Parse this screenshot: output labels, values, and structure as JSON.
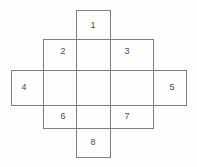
{
  "figure": {
    "kind": "cross-plus-grid-diagram",
    "background_color": "#fdfdfd",
    "line_color": "#7e7e7e",
    "label_color": "#4a4a4a",
    "line_width": 1,
    "canvas": {
      "width": 197,
      "height": 167
    },
    "geometry": {
      "outer_left": 11,
      "outer_right": 186,
      "outer_top": 10,
      "outer_bottom": 157,
      "vbar_left": 76,
      "vbar_right": 110,
      "hbar_top": 70,
      "hbar_bottom": 105,
      "inner_left": 43,
      "inner_right": 153,
      "inner_top": 39,
      "inner_bottom": 128,
      "cross_outline_points": "76,10 110,10 110,39 153,39 153,70 186,70 186,105 153,105 153,128 110,128 110,157 76,157 76,128 43,128 43,105 11,105 11,70 43,70 43,39 76,39 76,10",
      "divider_segments": [
        {
          "name": "vbar-left-edge",
          "x1": 76,
          "y1": 10,
          "x2": 76,
          "y2": 157
        },
        {
          "name": "vbar-right-edge",
          "x1": 110,
          "y1": 10,
          "x2": 110,
          "y2": 157
        },
        {
          "name": "hbar-top-edge",
          "x1": 11,
          "y1": 70,
          "x2": 186,
          "y2": 70
        },
        {
          "name": "hbar-bottom-edge",
          "x1": 11,
          "y1": 105,
          "x2": 186,
          "y2": 105
        },
        {
          "name": "inner-left-edge",
          "x1": 43,
          "y1": 39,
          "x2": 43,
          "y2": 128
        },
        {
          "name": "inner-right-edge",
          "x1": 153,
          "y1": 39,
          "x2": 153,
          "y2": 128
        },
        {
          "name": "inner-top-edge",
          "x1": 43,
          "y1": 39,
          "x2": 153,
          "y2": 39
        },
        {
          "name": "inner-bottom-edge",
          "x1": 43,
          "y1": 128,
          "x2": 153,
          "y2": 128
        }
      ]
    },
    "cells": [
      {
        "id": "cell-1",
        "label": "1",
        "position": "top",
        "cx": 93,
        "cy": 26
      },
      {
        "id": "cell-2",
        "label": "2",
        "position": "upper-left",
        "cx": 63,
        "cy": 52
      },
      {
        "id": "cell-3",
        "label": "3",
        "position": "upper-right",
        "cx": 127,
        "cy": 52
      },
      {
        "id": "cell-4",
        "label": "4",
        "position": "left",
        "cx": 24,
        "cy": 88
      },
      {
        "id": "cell-5",
        "label": "5",
        "position": "right",
        "cx": 172,
        "cy": 88
      },
      {
        "id": "cell-6",
        "label": "6",
        "position": "lower-left",
        "cx": 63,
        "cy": 117
      },
      {
        "id": "cell-7",
        "label": "7",
        "position": "lower-right",
        "cx": 127,
        "cy": 117
      },
      {
        "id": "cell-8",
        "label": "8",
        "position": "bottom",
        "cx": 93,
        "cy": 143
      }
    ]
  }
}
